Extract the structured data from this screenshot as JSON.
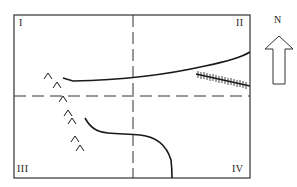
{
  "diagram": {
    "type": "schematic map",
    "frame": {
      "x": 14,
      "y": 15,
      "width": 236,
      "height": 163,
      "stroke": "#333333"
    },
    "axes": {
      "vertical_dashed_x": 133,
      "horizontal_dashed_y": 96,
      "style": "dashed"
    },
    "quadrants": [
      {
        "id": "I",
        "label": "I",
        "position": "top-left"
      },
      {
        "id": "II",
        "label": "II",
        "position": "top-right"
      },
      {
        "id": "III",
        "label": "III",
        "position": "bottom-left"
      },
      {
        "id": "IV",
        "label": "IV",
        "position": "bottom-right"
      }
    ],
    "north_arrow": {
      "label": "N"
    },
    "features": [
      {
        "name": "upper-curve",
        "kind": "solid line",
        "description": "curved line crossing quadrants I and II, rising toward the east"
      },
      {
        "name": "lower-curve",
        "kind": "solid line",
        "description": "curved line in quadrants III and IV, bending south to the bottom edge"
      },
      {
        "name": "hatched-line",
        "kind": "hachured line",
        "description": "line with tick marks in quadrant II near the east edge"
      },
      {
        "name": "chevron-chain",
        "kind": "chevron symbols",
        "count": 7,
        "description": "chain of ^ symbols running from quadrant I down into quadrant III"
      }
    ],
    "colors": {
      "line": "#1a1a1a",
      "frame": "#333333",
      "background": "#ffffff"
    }
  }
}
